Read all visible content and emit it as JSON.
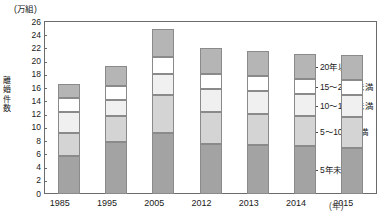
{
  "chart_data": {
    "type": "bar",
    "title": "",
    "subtitle": "",
    "stacked": true,
    "xlabel": "(年)",
    "ylabel": "離婚件数",
    "yunit": "(万組)",
    "ylim": [
      0,
      26
    ],
    "yticks": [
      0,
      2,
      4,
      6,
      8,
      10,
      12,
      14,
      16,
      18,
      20,
      22,
      24,
      26
    ],
    "grid": false,
    "legend_position": "right",
    "categories": [
      "1985",
      "1995",
      "2005",
      "2012",
      "2013",
      "2014",
      "2015"
    ],
    "series": [
      {
        "name": "5年未満",
        "color": "#a3a3a3",
        "values": [
          5.7,
          7.8,
          9.2,
          7.6,
          7.4,
          7.2,
          7.0
        ]
      },
      {
        "name": "5～10年未満",
        "color": "#d4d4d4",
        "values": [
          3.5,
          4.0,
          5.7,
          4.8,
          4.7,
          4.6,
          4.6
        ]
      },
      {
        "name": "10～15年未満",
        "color": "#f0f0f0",
        "values": [
          3.2,
          2.4,
          3.3,
          3.5,
          3.4,
          3.3,
          3.3
        ]
      },
      {
        "name": "15～20年未満",
        "color": "#ffffff",
        "values": [
          2.1,
          2.1,
          2.5,
          2.3,
          2.3,
          2.3,
          2.3
        ]
      },
      {
        "name": "20年以上",
        "color": "#b5b5b5",
        "values": [
          2.1,
          3.1,
          4.3,
          3.8,
          3.8,
          3.8,
          3.8
        ]
      }
    ],
    "totals": [
      16.6,
      19.4,
      25.0,
      22.0,
      21.6,
      21.2,
      21.0
    ],
    "cumulative_tops": [
      [
        5.7,
        9.2,
        12.4,
        14.5,
        16.6
      ],
      [
        7.8,
        11.8,
        14.2,
        16.3,
        19.4
      ],
      [
        9.2,
        14.9,
        18.2,
        20.7,
        25.0
      ],
      [
        7.6,
        12.4,
        15.9,
        18.2,
        22.0
      ],
      [
        7.4,
        12.1,
        15.5,
        17.8,
        21.6
      ],
      [
        7.2,
        11.8,
        15.1,
        17.4,
        21.2
      ],
      [
        7.0,
        11.6,
        14.9,
        17.2,
        21.0
      ]
    ]
  },
  "legend": {
    "items": [
      {
        "label": "20年以上"
      },
      {
        "label": "15～20年未満"
      },
      {
        "label": "10～15年未満"
      },
      {
        "label": "5～10年未満"
      },
      {
        "label": "5年未満"
      }
    ]
  },
  "axis_y": {
    "unit": "(万組)",
    "title_chars": [
      "離",
      "婚",
      "件",
      "数"
    ],
    "ticks": [
      "26",
      "24",
      "22",
      "20",
      "18",
      "16",
      "14",
      "12",
      "10",
      "8",
      "6",
      "4",
      "2",
      "0"
    ]
  },
  "axis_x": {
    "unit": "(年)",
    "ticks": [
      "1985",
      "1995",
      "2005",
      "2012",
      "2013",
      "2014",
      "2015"
    ]
  }
}
